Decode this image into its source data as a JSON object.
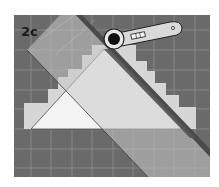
{
  "figure": {
    "step_label": "2c",
    "colors": {
      "mat": "#6a6a6a",
      "grid": "#9a9a9a",
      "fabric_steps": "#d4d4d4",
      "triangle": "#f2f2f2",
      "ruler": "#c8c8c8",
      "ruler_edge": "#4e4e4e",
      "cutter_body": "#d9d9d9",
      "cutter_blade_hub": "#111111"
    },
    "icons": {
      "cutter": "rotary-cutter-icon",
      "ruler": "ruler-icon"
    }
  }
}
